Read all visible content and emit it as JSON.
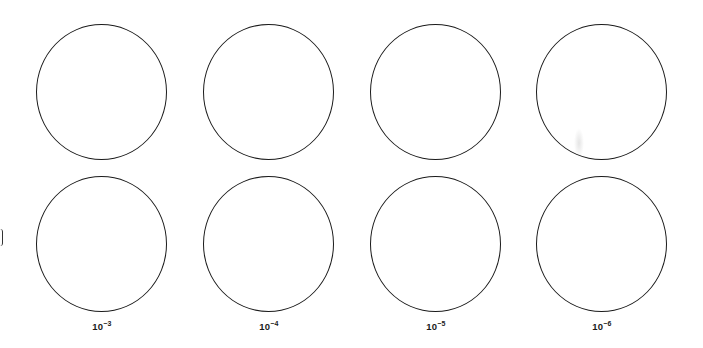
{
  "figure": {
    "layout": {
      "rows": 2,
      "columns": 4
    },
    "stroke_color": "#1a1a1a",
    "background_color": "#ffffff",
    "columns": [
      {
        "label_base": "10",
        "label_exponent": "−3",
        "center_x": 102
      },
      {
        "label_base": "10",
        "label_exponent": "−4",
        "center_x": 269
      },
      {
        "label_base": "10",
        "label_exponent": "−5",
        "center_x": 436
      },
      {
        "label_base": "10",
        "label_exponent": "−6",
        "center_x": 602
      }
    ],
    "row_centers_y": [
      92,
      244
    ],
    "circle_radius": 67
  }
}
